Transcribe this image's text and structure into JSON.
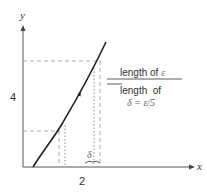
{
  "diagram": {
    "axis_labels": {
      "x": "x",
      "y": "y"
    },
    "ticks": {
      "x": "2",
      "y": "4"
    },
    "delta_label": "δ",
    "legend": {
      "line1_text": "length of ",
      "line1_symbol": "ε",
      "line2_text": "length  of",
      "line3": "δ = ε/5"
    },
    "colors": {
      "axis": "#555555",
      "curve": "#222222",
      "dashed": "#aaaaaa",
      "text": "#333333"
    }
  }
}
